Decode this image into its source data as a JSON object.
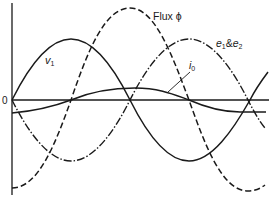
{
  "diagram": {
    "type": "waveform",
    "axes": {
      "origin_label": "0"
    },
    "curves": [
      {
        "id": "v1",
        "label": "v",
        "subscript": "1",
        "style": "solid",
        "description": "applied voltage"
      },
      {
        "id": "flux",
        "label": "Flux ϕ",
        "style": "dashed",
        "description": "magnetic flux"
      },
      {
        "id": "e1e2",
        "label_parts": [
          "e",
          "1",
          "&",
          "e",
          "2"
        ],
        "style": "dash-dot",
        "description": "induced emfs"
      },
      {
        "id": "i0",
        "label": "i",
        "subscript": "0",
        "style": "solid",
        "description": "no-load current"
      }
    ],
    "colors": {
      "line": "#1a1a1a",
      "background": "#ffffff"
    }
  }
}
